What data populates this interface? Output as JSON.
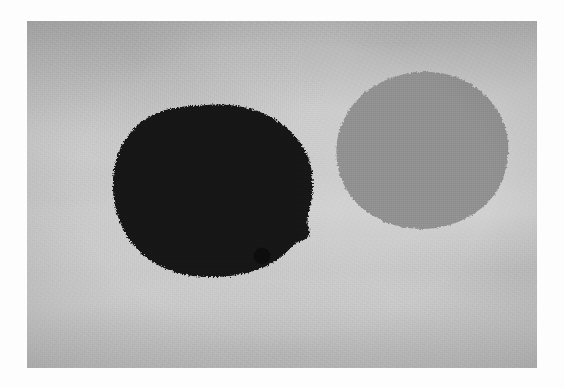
{
  "artwork": {
    "medium_description": "Black-and-white photographic print of an abstract composition",
    "mount_color": "#fdfdfd",
    "print": {
      "background_color": "#cacaca",
      "left": 27,
      "top": 21,
      "width": 510,
      "height": 347
    },
    "annotation": {
      "text": "· · ·",
      "visible": true
    },
    "shapes": [
      {
        "id": "large-dark-blob",
        "label": "Large dark blob",
        "color": "#121212",
        "tone": "black",
        "center_x": 182,
        "center_y": 170,
        "width": 209,
        "height": 172,
        "bounds": {
          "left": 76,
          "top": 84,
          "right": 285,
          "bottom": 256
        }
      },
      {
        "id": "large-gray-blob",
        "label": "Large gray blob",
        "color": "#919191",
        "tone": "mid-gray",
        "center_x": 397,
        "center_y": 128,
        "width": 179,
        "height": 156,
        "bounds": {
          "left": 308,
          "top": 50,
          "right": 487,
          "bottom": 206
        }
      },
      {
        "id": "small-dark-dot",
        "label": "Small dark dot",
        "color": "#101010",
        "tone": "black",
        "center_x": 253,
        "center_y": 253,
        "width": 17,
        "height": 17,
        "bounds": {
          "left": 245,
          "top": 245,
          "right": 262,
          "bottom": 262
        }
      }
    ]
  }
}
